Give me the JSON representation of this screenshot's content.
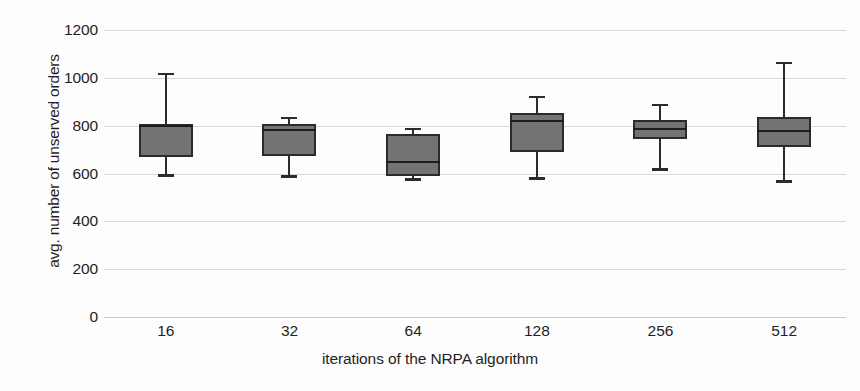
{
  "chart_data": {
    "type": "box",
    "title": "",
    "xlabel": "iterations of the NRPA algorithm",
    "ylabel": "avg. number of unserved orders",
    "categories": [
      "16",
      "32",
      "64",
      "128",
      "256",
      "512"
    ],
    "ylim": [
      0,
      1200
    ],
    "yticks": [
      0,
      200,
      400,
      600,
      800,
      1000,
      1200
    ],
    "ytick_labels": [
      "0",
      "200",
      "400",
      "600",
      "800",
      "1000",
      "1200"
    ],
    "grid": true,
    "legend": "none",
    "series": [
      {
        "name": "avg. number of unserved orders",
        "boxes": [
          {
            "category": "16",
            "whisker_low": 595,
            "q1": 670,
            "median": 800,
            "q3": 805,
            "whisker_high": 1020
          },
          {
            "category": "32",
            "whisker_low": 588,
            "q1": 675,
            "median": 780,
            "q3": 805,
            "whisker_high": 835
          },
          {
            "category": "64",
            "whisker_low": 577,
            "q1": 588,
            "median": 650,
            "q3": 765,
            "whisker_high": 790
          },
          {
            "category": "128",
            "whisker_low": 580,
            "q1": 690,
            "median": 820,
            "q3": 853,
            "whisker_high": 925
          },
          {
            "category": "256",
            "whisker_low": 620,
            "q1": 745,
            "median": 785,
            "q3": 825,
            "whisker_high": 890
          },
          {
            "category": "512",
            "whisker_low": 570,
            "q1": 710,
            "median": 778,
            "q3": 838,
            "whisker_high": 1065
          }
        ]
      }
    ],
    "colors": {
      "box_fill": "#737373",
      "box_border": "#2b2b2b",
      "median": "#1d1d1d",
      "whisker": "#2b2b2b",
      "gridline": "#d8d8d8",
      "background": "#fdfdfd",
      "text": "#1f1f1f"
    }
  }
}
